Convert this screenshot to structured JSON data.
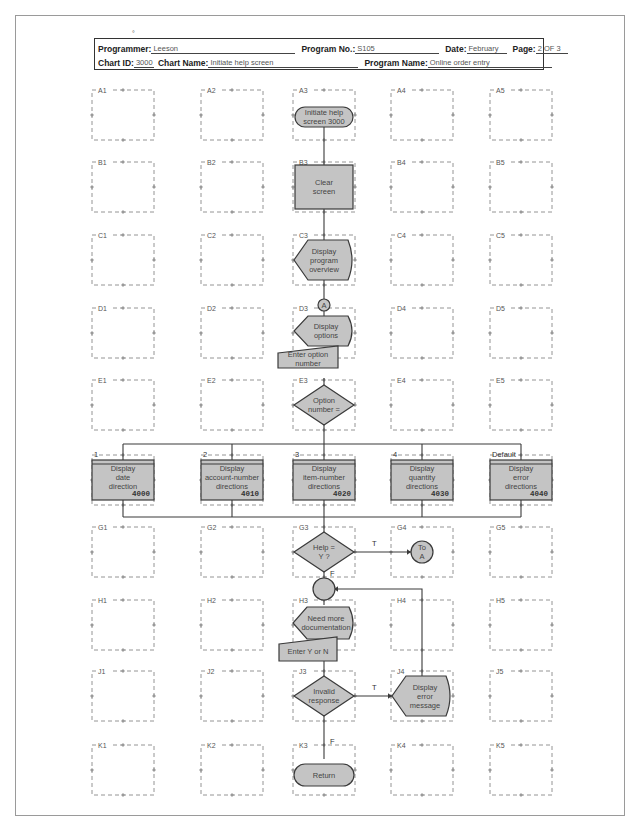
{
  "header": {
    "programmer_label": "Programmer:",
    "programmer": "Leeson",
    "program_no_label": "Program No.:",
    "program_no": "S105",
    "date_label": "Date:",
    "date": "February",
    "page_label": "Page:",
    "page": "2 OF 3",
    "chart_id_label": "Chart ID:",
    "chart_id": "3000",
    "chart_name_label": "Chart Name:",
    "chart_name": "Initiate help screen",
    "program_name_label": "Program Name:",
    "program_name": "Online order entry"
  },
  "colors": {
    "fill": "#c4c4c4",
    "stroke": "#3a3a3a",
    "grid": "#7a7a7a",
    "border": "#9a9a9a"
  },
  "grid": {
    "columns": [
      1,
      2,
      3,
      4,
      5
    ],
    "rows": [
      "A",
      "B",
      "C",
      "D",
      "E",
      "F",
      "G",
      "H",
      "J",
      "K"
    ],
    "col_x": [
      123,
      232,
      324,
      422,
      521
    ],
    "row_y": [
      115,
      187,
      260,
      333,
      405,
      480,
      552,
      625,
      696,
      770
    ]
  },
  "nodes": {
    "A3": {
      "type": "terminal",
      "lines": [
        "Initiate help",
        "screen 3000"
      ]
    },
    "B3": {
      "type": "process",
      "lines": [
        "Clear",
        "screen"
      ]
    },
    "C3": {
      "type": "display",
      "lines": [
        "Display",
        "program",
        "overview"
      ]
    },
    "connA": {
      "type": "connector",
      "lines": [
        "A"
      ]
    },
    "D3": {
      "type": "display",
      "lines": [
        "Display",
        "options"
      ]
    },
    "D3_input": {
      "type": "manual-input",
      "lines": [
        "Enter option",
        "number"
      ]
    },
    "E3": {
      "type": "decision",
      "lines": [
        "Option",
        "number ="
      ]
    },
    "F1": {
      "type": "predefined",
      "lines": [
        "Display",
        "date",
        "direction"
      ],
      "number": "4000",
      "branch": "1"
    },
    "F2": {
      "type": "predefined",
      "lines": [
        "Display",
        "account-number",
        "directions"
      ],
      "number": "4010",
      "branch": "2"
    },
    "F3": {
      "type": "predefined",
      "lines": [
        "Display",
        "item-number",
        "directions"
      ],
      "number": "4020",
      "branch": "3"
    },
    "F4": {
      "type": "predefined",
      "lines": [
        "Display",
        "quantity",
        "directions"
      ],
      "number": "4030",
      "branch": "4"
    },
    "F5": {
      "type": "predefined",
      "lines": [
        "Display",
        "error",
        "directions"
      ],
      "number": "4040",
      "branch": "Default"
    },
    "G3": {
      "type": "decision",
      "lines": [
        "Help =",
        "Y ?"
      ]
    },
    "G4": {
      "type": "connector",
      "lines": [
        "To",
        "A"
      ]
    },
    "connH": {
      "type": "connector",
      "lines": []
    },
    "H3": {
      "type": "display",
      "lines": [
        "Need more",
        "documentation"
      ]
    },
    "H3_input": {
      "type": "manual-input",
      "lines": [
        "Enter Y or N"
      ]
    },
    "J3": {
      "type": "decision",
      "lines": [
        "Invalid",
        "response"
      ]
    },
    "J4": {
      "type": "display",
      "lines": [
        "Display",
        "error",
        "message"
      ]
    },
    "K3": {
      "type": "terminal",
      "lines": [
        "Return"
      ]
    }
  },
  "edge_labels": {
    "G3_true": "T",
    "G3_false": "F",
    "J3_true": "T",
    "J3_false": "F"
  }
}
